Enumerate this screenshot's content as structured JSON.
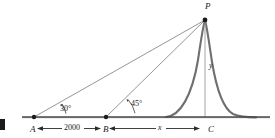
{
  "figure": {
    "type": "trigonometry-elevation-diagram",
    "points": {
      "peak": "P",
      "left_station": "A",
      "mid_station": "B",
      "base": "C"
    },
    "angles": {
      "at_A": "30°",
      "at_B": "45°"
    },
    "dimensions": {
      "A_to_B": "2000",
      "B_to_C": "x",
      "height": "y"
    },
    "colors": {
      "ink": "#1b1b1b",
      "curve": "#6f6f6f",
      "sightline": "#8a8a8a",
      "baseline": "#4a4a4a",
      "background": "#ffffff"
    },
    "geometry": {
      "baseline_y": 117,
      "peak": [
        205,
        19
      ],
      "A": [
        34,
        117
      ],
      "B": [
        106,
        117
      ],
      "C": [
        205,
        117
      ],
      "baseline_start": 22,
      "baseline_end": 270
    }
  }
}
